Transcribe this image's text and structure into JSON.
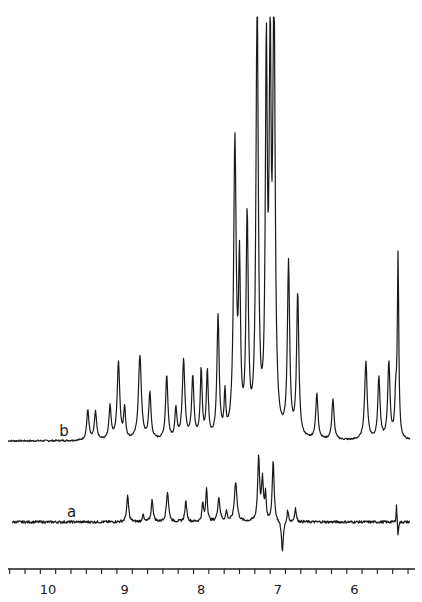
{
  "chart_data": {
    "type": "line",
    "title": "",
    "xlabel": "",
    "ylabel": "",
    "x_unit": "ppm (chemical shift)",
    "x_direction": "decreasing left-to-right",
    "xlim": [
      10.5,
      5.3
    ],
    "xticks_major": [
      10,
      9,
      8,
      7,
      6
    ],
    "xtick_labels": [
      "10",
      "9",
      "8",
      "7",
      "6"
    ],
    "xtick_minor_step": 0.2,
    "grid": false,
    "legend": "inline trace labels",
    "series": [
      {
        "name": "b",
        "label": "b",
        "label_pos_ppm": 9.75,
        "baseline_rel": 0,
        "peaks": [
          {
            "ppm": 9.48,
            "height": 30,
            "width": 0.035
          },
          {
            "ppm": 9.38,
            "height": 28,
            "width": 0.035
          },
          {
            "ppm": 9.19,
            "height": 33,
            "width": 0.035
          },
          {
            "ppm": 9.08,
            "height": 77,
            "width": 0.04
          },
          {
            "ppm": 9.0,
            "height": 30,
            "width": 0.03
          },
          {
            "ppm": 8.8,
            "height": 84,
            "width": 0.045
          },
          {
            "ppm": 8.67,
            "height": 46,
            "width": 0.035
          },
          {
            "ppm": 8.45,
            "height": 64,
            "width": 0.035
          },
          {
            "ppm": 8.33,
            "height": 30,
            "width": 0.03
          },
          {
            "ppm": 8.23,
            "height": 78,
            "width": 0.04
          },
          {
            "ppm": 8.11,
            "height": 62,
            "width": 0.035
          },
          {
            "ppm": 8.0,
            "height": 68,
            "width": 0.03
          },
          {
            "ppm": 7.92,
            "height": 66,
            "width": 0.03
          },
          {
            "ppm": 7.78,
            "height": 120,
            "width": 0.035
          },
          {
            "ppm": 7.69,
            "height": 40,
            "width": 0.025
          },
          {
            "ppm": 7.56,
            "height": 292,
            "width": 0.04
          },
          {
            "ppm": 7.5,
            "height": 160,
            "width": 0.03
          },
          {
            "ppm": 7.4,
            "height": 215,
            "width": 0.035
          },
          {
            "ppm": 7.27,
            "height": 440,
            "width": 0.035
          },
          {
            "ppm": 7.15,
            "height": 370,
            "width": 0.03
          },
          {
            "ppm": 7.1,
            "height": 360,
            "width": 0.03
          },
          {
            "ppm": 7.05,
            "height": 440,
            "width": 0.035
          },
          {
            "ppm": 6.86,
            "height": 172,
            "width": 0.035
          },
          {
            "ppm": 6.74,
            "height": 143,
            "width": 0.035
          },
          {
            "ppm": 6.49,
            "height": 45,
            "width": 0.035
          },
          {
            "ppm": 6.28,
            "height": 40,
            "width": 0.035
          },
          {
            "ppm": 5.85,
            "height": 78,
            "width": 0.04
          },
          {
            "ppm": 5.68,
            "height": 62,
            "width": 0.035
          },
          {
            "ppm": 5.55,
            "height": 77,
            "width": 0.035
          },
          {
            "ppm": 5.46,
            "height": 40,
            "width": 0.03
          },
          {
            "ppm": 5.43,
            "height": 180,
            "width": 0.022
          }
        ]
      },
      {
        "name": "a",
        "label": "a",
        "label_pos_ppm": 9.7,
        "baseline_rel": 0,
        "peaks": [
          {
            "ppm": 8.96,
            "height": 26,
            "width": 0.03
          },
          {
            "ppm": 8.76,
            "height": 8,
            "width": 0.02
          },
          {
            "ppm": 8.64,
            "height": 22,
            "width": 0.03
          },
          {
            "ppm": 8.44,
            "height": 30,
            "width": 0.035
          },
          {
            "ppm": 8.2,
            "height": 20,
            "width": 0.03
          },
          {
            "ppm": 7.98,
            "height": 18,
            "width": 0.025
          },
          {
            "ppm": 7.93,
            "height": 34,
            "width": 0.025
          },
          {
            "ppm": 7.77,
            "height": 24,
            "width": 0.035
          },
          {
            "ppm": 7.67,
            "height": 10,
            "width": 0.025
          },
          {
            "ppm": 7.55,
            "height": 40,
            "width": 0.04
          },
          {
            "ppm": 7.25,
            "height": 64,
            "width": 0.03
          },
          {
            "ppm": 7.2,
            "height": 40,
            "width": 0.03
          },
          {
            "ppm": 7.16,
            "height": 26,
            "width": 0.02
          },
          {
            "ppm": 7.06,
            "height": 60,
            "width": 0.03
          },
          {
            "ppm": 6.94,
            "height": -30,
            "width": 0.03
          },
          {
            "ppm": 6.87,
            "height": 12,
            "width": 0.025
          },
          {
            "ppm": 6.77,
            "height": 14,
            "width": 0.025
          },
          {
            "ppm": 5.45,
            "height": 18,
            "width": 0.012
          },
          {
            "ppm": 5.43,
            "height": -16,
            "width": 0.012
          }
        ]
      }
    ]
  },
  "layout": {
    "axis_y": 569,
    "ppm_origin": 10,
    "x_at_origin": 48,
    "px_per_ppm": 76.6,
    "x_min_px": 8,
    "x_max_px": 415,
    "trace_b_baseline_y": 441,
    "trace_b_x_start": 8,
    "trace_b_x_end": 410,
    "trace_a_baseline_y": 522,
    "trace_a_x_start": 12,
    "trace_a_x_end": 410
  },
  "labels": {
    "trace_b": "b",
    "trace_a": "a"
  },
  "colors": {
    "ink": "#1a1a1a",
    "background": "#ffffff"
  }
}
